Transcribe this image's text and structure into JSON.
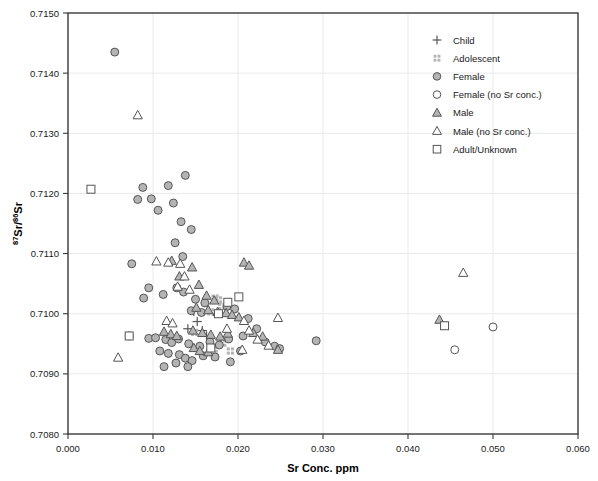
{
  "chart_data": {
    "type": "scatter",
    "title": "",
    "xlabel": "Sr Conc. ppm",
    "ylabel": "87Sr/86Sr",
    "ylabel_parts": {
      "sup1": "87",
      "mid": "Sr/",
      "sup2": "86",
      "end": "Sr"
    },
    "xlim": [
      0.0,
      0.06
    ],
    "ylim": [
      0.708,
      0.715
    ],
    "xticks": [
      "0.000",
      "0.010",
      "0.020",
      "0.030",
      "0.040",
      "0.050",
      "0.060"
    ],
    "xtick_values": [
      0.0,
      0.01,
      0.02,
      0.03,
      0.04,
      0.05,
      0.06
    ],
    "yticks": [
      "0.7080",
      "0.7090",
      "0.7100",
      "0.7110",
      "0.7120",
      "0.7130",
      "0.7140",
      "0.7150"
    ],
    "ytick_values": [
      0.708,
      0.709,
      0.71,
      0.711,
      0.712,
      0.713,
      0.714,
      0.715
    ],
    "grid": true,
    "legend_position": "top-right",
    "legend": [
      {
        "key": "child",
        "label": "Child",
        "marker": "plus"
      },
      {
        "key": "adolescent",
        "label": "Adolescent",
        "marker": "grid-squares"
      },
      {
        "key": "female",
        "label": "Female",
        "marker": "filled-circle"
      },
      {
        "key": "female_no_sr",
        "label": "Female (no Sr conc.)",
        "marker": "open-circle"
      },
      {
        "key": "male",
        "label": "Male",
        "marker": "filled-triangle"
      },
      {
        "key": "male_no_sr",
        "label": "Male (no Sr conc.)",
        "marker": "open-triangle"
      },
      {
        "key": "adult_unknown",
        "label": "Adult/Unknown",
        "marker": "open-square"
      }
    ],
    "series": [
      {
        "name": "Child",
        "marker": "plus",
        "points": [
          [
            0.0148,
            0.71004
          ],
          [
            0.0152,
            0.70987
          ],
          [
            0.0141,
            0.70975
          ],
          [
            0.0158,
            0.70972
          ],
          [
            0.0163,
            0.70963
          ]
        ]
      },
      {
        "name": "Adolescent",
        "marker": "grid-squares",
        "points": [
          [
            0.0173,
            0.71026
          ],
          [
            0.0177,
            0.71023
          ],
          [
            0.0181,
            0.71012
          ],
          [
            0.0168,
            0.71003
          ],
          [
            0.0149,
            0.70969
          ],
          [
            0.0182,
            0.70951
          ],
          [
            0.0172,
            0.70941
          ],
          [
            0.0191,
            0.70938
          ]
        ]
      },
      {
        "name": "Female",
        "marker": "filled-circle",
        "points": [
          [
            0.0055,
            0.71435
          ],
          [
            0.0088,
            0.7121
          ],
          [
            0.0098,
            0.71191
          ],
          [
            0.0082,
            0.7119
          ],
          [
            0.0106,
            0.71172
          ],
          [
            0.0124,
            0.71184
          ],
          [
            0.0138,
            0.7123
          ],
          [
            0.0118,
            0.71213
          ],
          [
            0.0133,
            0.71153
          ],
          [
            0.0145,
            0.7114
          ],
          [
            0.0126,
            0.71118
          ],
          [
            0.0135,
            0.71095
          ],
          [
            0.0075,
            0.71083
          ],
          [
            0.0095,
            0.71043
          ],
          [
            0.0089,
            0.71026
          ],
          [
            0.0112,
            0.71032
          ],
          [
            0.0128,
            0.71043
          ],
          [
            0.0136,
            0.71036
          ],
          [
            0.015,
            0.71024
          ],
          [
            0.0161,
            0.71018
          ],
          [
            0.0187,
            0.71012
          ],
          [
            0.0145,
            0.71005
          ],
          [
            0.0157,
            0.71002
          ],
          [
            0.0196,
            0.71008
          ],
          [
            0.0212,
            0.70992
          ],
          [
            0.0072,
            0.70963
          ],
          [
            0.0095,
            0.70959
          ],
          [
            0.0103,
            0.7096
          ],
          [
            0.0115,
            0.70957
          ],
          [
            0.0122,
            0.70952
          ],
          [
            0.013,
            0.70958
          ],
          [
            0.0142,
            0.7095
          ],
          [
            0.0155,
            0.70946
          ],
          [
            0.0167,
            0.70953
          ],
          [
            0.0178,
            0.70948
          ],
          [
            0.0189,
            0.70958
          ],
          [
            0.0206,
            0.70963
          ],
          [
            0.0222,
            0.70975
          ],
          [
            0.0232,
            0.70953
          ],
          [
            0.0108,
            0.70938
          ],
          [
            0.0118,
            0.70934
          ],
          [
            0.0131,
            0.70932
          ],
          [
            0.0138,
            0.70926
          ],
          [
            0.0146,
            0.70922
          ],
          [
            0.0159,
            0.7093
          ],
          [
            0.0173,
            0.70928
          ],
          [
            0.0191,
            0.7092
          ],
          [
            0.0203,
            0.70938
          ],
          [
            0.0243,
            0.70946
          ],
          [
            0.0249,
            0.70942
          ],
          [
            0.0292,
            0.70955
          ],
          [
            0.0113,
            0.70912
          ],
          [
            0.0127,
            0.70918
          ],
          [
            0.0141,
            0.70912
          ]
        ]
      },
      {
        "name": "Female (no Sr conc.)",
        "marker": "open-circle",
        "points": [
          [
            0.05,
            0.70978
          ],
          [
            0.0455,
            0.7094
          ]
        ]
      },
      {
        "name": "Male",
        "marker": "filled-triangle",
        "points": [
          [
            0.0122,
            0.71088
          ],
          [
            0.0146,
            0.71077
          ],
          [
            0.0207,
            0.71085
          ],
          [
            0.0213,
            0.7108
          ],
          [
            0.0131,
            0.71062
          ],
          [
            0.0154,
            0.71048
          ],
          [
            0.0163,
            0.7103
          ],
          [
            0.0172,
            0.71022
          ],
          [
            0.0151,
            0.7101
          ],
          [
            0.0165,
            0.71006
          ],
          [
            0.0176,
            0.71003
          ],
          [
            0.0186,
            0.71001
          ],
          [
            0.0193,
            0.70998
          ],
          [
            0.0201,
            0.70994
          ],
          [
            0.0113,
            0.7097
          ],
          [
            0.0121,
            0.70966
          ],
          [
            0.0128,
            0.70963
          ],
          [
            0.0147,
            0.70972
          ],
          [
            0.0158,
            0.70968
          ],
          [
            0.0168,
            0.70965
          ],
          [
            0.0179,
            0.70962
          ],
          [
            0.0188,
            0.70967
          ],
          [
            0.0218,
            0.70968
          ],
          [
            0.0229,
            0.70962
          ],
          [
            0.0148,
            0.70943
          ],
          [
            0.0155,
            0.70938
          ],
          [
            0.0165,
            0.70936
          ],
          [
            0.0247,
            0.7094
          ],
          [
            0.0437,
            0.7099
          ]
        ]
      },
      {
        "name": "Male (no Sr conc.)",
        "marker": "open-triangle",
        "points": [
          [
            0.0082,
            0.7133
          ],
          [
            0.0104,
            0.71087
          ],
          [
            0.0118,
            0.71085
          ],
          [
            0.0132,
            0.71083
          ],
          [
            0.0137,
            0.71062
          ],
          [
            0.0129,
            0.71045
          ],
          [
            0.0143,
            0.7104
          ],
          [
            0.0116,
            0.70988
          ],
          [
            0.0123,
            0.70984
          ],
          [
            0.0207,
            0.70988
          ],
          [
            0.0247,
            0.70993
          ],
          [
            0.0187,
            0.70975
          ],
          [
            0.0213,
            0.70972
          ],
          [
            0.0223,
            0.70957
          ],
          [
            0.0236,
            0.70947
          ],
          [
            0.0059,
            0.70927
          ],
          [
            0.0205,
            0.7094
          ],
          [
            0.0465,
            0.71068
          ]
        ]
      },
      {
        "name": "Adult/Unknown",
        "marker": "open-square",
        "points": [
          [
            0.0027,
            0.71207
          ],
          [
            0.0072,
            0.70963
          ],
          [
            0.0201,
            0.71028
          ],
          [
            0.0188,
            0.71019
          ],
          [
            0.0177,
            0.71
          ],
          [
            0.0168,
            0.70943
          ],
          [
            0.0443,
            0.7098
          ]
        ]
      }
    ]
  }
}
